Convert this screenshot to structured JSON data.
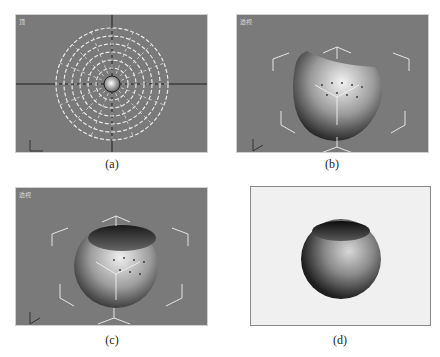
{
  "figure": {
    "panels": [
      {
        "id": "a",
        "caption": "(a)",
        "viewport_label": "顶",
        "view": "top",
        "content": "hemisphere wireframe with radial segments, viewed from top"
      },
      {
        "id": "b",
        "caption": "(b)",
        "viewport_label": "透视",
        "view": "perspective",
        "content": "sphere with top cap cut off, selection brackets"
      },
      {
        "id": "c",
        "caption": "(c)",
        "viewport_label": "透视",
        "view": "perspective",
        "content": "open bowl-shaped sphere with vertices shown, selection brackets"
      },
      {
        "id": "d",
        "caption": "(d)",
        "viewport_label": "",
        "view": "rendered",
        "content": "rendered open sphere bowl"
      }
    ]
  },
  "colors": {
    "viewport_bg": "#7a7a7a",
    "render_bg": "#f0f0f0",
    "wireframe": "#e6e6e6",
    "grid": "#2a2a2a"
  }
}
